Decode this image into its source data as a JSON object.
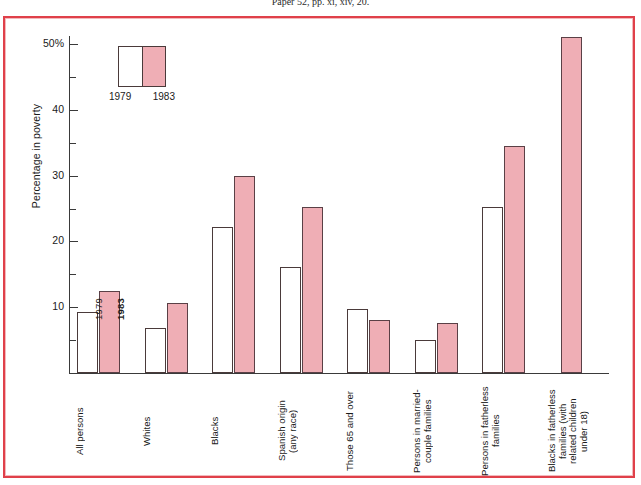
{
  "source_line": "Paper 52, pp. xi, xiv, 20.",
  "colors": {
    "frame_border": "#e0404a",
    "frame_inner": "#f3b9bd",
    "bar_1983_fill": "#efaeb5",
    "bar_1979_fill": "#ffffff",
    "bar_outline": "#4a3a3a",
    "axis": "#3a3a3a",
    "text": "#1a1a1a"
  },
  "legend": {
    "name": "year-legend",
    "entries": [
      {
        "label": "1979",
        "swatch": "white"
      },
      {
        "label": "1983",
        "swatch": "pink"
      }
    ]
  },
  "inline_bar_labels": {
    "first_pair_1979": "1979",
    "first_pair_1983": "1983"
  },
  "axis": {
    "y_title": "Percentage in poverty",
    "major_ticks": [
      {
        "value": 50,
        "label": "50%"
      },
      {
        "value": 40,
        "label": "40"
      },
      {
        "value": 30,
        "label": "30"
      },
      {
        "value": 20,
        "label": "20"
      },
      {
        "value": 10,
        "label": "10"
      }
    ],
    "minor_ticks": [
      45,
      35,
      25,
      15,
      5
    ]
  },
  "chart_data": {
    "type": "bar",
    "title": "",
    "subtitle": "",
    "xlabel": "",
    "ylabel": "Percentage in poverty",
    "ylim": [
      0,
      53
    ],
    "grid": false,
    "legend_position": "top-left-inside",
    "categories": [
      "All persons",
      "Whites",
      "Blacks",
      "Spanish origin\n(any race)",
      "Those 65 and over",
      "Persons in married-\ncouple families",
      "Persons in fatherless\nfamilies",
      "Blacks in fatherless\nfamilies (with\nrelated children\nunder 18)"
    ],
    "series": [
      {
        "name": "1979",
        "color": "#ffffff",
        "values": [
          9.2,
          6.8,
          22.2,
          16.1,
          9.8,
          5.0,
          25.3,
          null
        ]
      },
      {
        "name": "1983",
        "color": "#efaeb5",
        "values": [
          12.5,
          10.7,
          29.9,
          25.2,
          8.0,
          7.6,
          34.5,
          51.0
        ]
      }
    ],
    "tick_labels_y": [
      "10",
      "20",
      "30",
      "40",
      "50%"
    ]
  }
}
